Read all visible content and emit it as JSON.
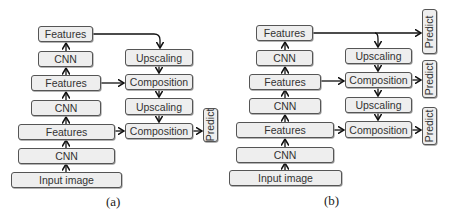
{
  "panels": [
    {
      "id": "a",
      "caption": "(a)",
      "backbone": [
        {
          "label": "Features"
        },
        {
          "label": "CNN"
        },
        {
          "label": "Features"
        },
        {
          "label": "CNN"
        },
        {
          "label": "Features"
        },
        {
          "label": "CNN"
        },
        {
          "label": "Input image"
        }
      ],
      "decoder": [
        {
          "label": "Upscaling"
        },
        {
          "label": "Composition"
        },
        {
          "label": "Upscaling"
        },
        {
          "label": "Composition"
        }
      ],
      "predict": [
        {
          "label": "Predict"
        }
      ]
    },
    {
      "id": "b",
      "caption": "(b)",
      "backbone": [
        {
          "label": "Features"
        },
        {
          "label": "CNN"
        },
        {
          "label": "Features"
        },
        {
          "label": "CNN"
        },
        {
          "label": "Features"
        },
        {
          "label": "CNN"
        },
        {
          "label": "Input image"
        }
      ],
      "decoder": [
        {
          "label": "Upscaling"
        },
        {
          "label": "Composition"
        },
        {
          "label": "Upscaling"
        },
        {
          "label": "Composition"
        }
      ],
      "predict": [
        {
          "label": "Predict"
        },
        {
          "label": "Predict"
        },
        {
          "label": "Predict"
        }
      ]
    }
  ],
  "colors": {
    "box_fill": "#eeeeee",
    "box_border": "#555555",
    "arrow": "#111111",
    "text": "#333333"
  }
}
